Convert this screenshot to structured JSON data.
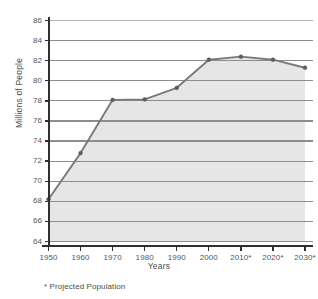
{
  "chart_data": {
    "type": "area",
    "title": "",
    "xlabel": "Years",
    "ylabel": "Millions of People",
    "categories": [
      "1950",
      "1960",
      "1970",
      "1980",
      "1990",
      "2000",
      "2010*",
      "2020*",
      "2030*"
    ],
    "values": [
      68.2,
      72.8,
      78.1,
      78.15,
      79.3,
      82.1,
      82.4,
      82.1,
      81.3
    ],
    "series": [
      {
        "name": "Population",
        "values": [
          68.2,
          72.8,
          78.1,
          78.15,
          79.3,
          82.1,
          82.4,
          82.1,
          81.3
        ]
      }
    ],
    "ylim": [
      64,
      86
    ],
    "ytick_step": 2,
    "ytick_labels": [
      "86",
      "84",
      "82",
      "80",
      "78",
      "76",
      "74",
      "72",
      "70",
      "68",
      "66",
      "64"
    ],
    "xtick_labels": [
      "1950",
      "1960",
      "1970",
      "1980",
      "1990",
      "2000",
      "2010*",
      "2020*",
      "2030*"
    ],
    "grid": true,
    "legend": "none",
    "annotations": [
      "* Projected Population"
    ],
    "colors": {
      "line": "#7a7a7a",
      "fill": "#e4e4e4",
      "grid": "#8d8d8d",
      "axis": "#2f2f2f",
      "marker": "#5d5d5d",
      "text": "#55565a",
      "background": "#ffffff"
    }
  },
  "footnote": {
    "text": "* Projected Population"
  },
  "axes": {
    "y_title": "Millions of People",
    "x_title": "Years"
  }
}
